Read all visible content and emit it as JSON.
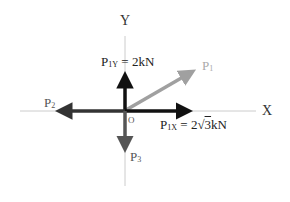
{
  "diagram": {
    "axes": {
      "x_label": "X",
      "y_label": "Y",
      "origin_label": "O"
    },
    "forces": [
      {
        "id": "P1",
        "base": "P",
        "sub": "1",
        "label": "P1",
        "direction": "up-right (30°)",
        "color": "#a0a0a0"
      },
      {
        "id": "P1X",
        "base": "P",
        "sub": "1X",
        "label": "P1X = 2√3kN",
        "eq": " = 2",
        "root": "√",
        "root_arg": "3",
        "unit": "kN",
        "direction": "right",
        "color": "#111111"
      },
      {
        "id": "P1Y",
        "base": "P",
        "sub": "1Y",
        "label": "P1Y = 2kN",
        "eq": " = 2kN",
        "direction": "up",
        "color": "#111111"
      },
      {
        "id": "P2",
        "base": "P",
        "sub": "2",
        "label": "P2",
        "direction": "left",
        "color": "#333333"
      },
      {
        "id": "P3",
        "base": "P",
        "sub": "3",
        "label": "P3",
        "direction": "down",
        "color": "#555555"
      }
    ],
    "colors": {
      "axis_line": "#cccccc",
      "p1": "#a0a0a0",
      "components": "#111111",
      "p2": "#333333",
      "p3": "#555555"
    }
  }
}
